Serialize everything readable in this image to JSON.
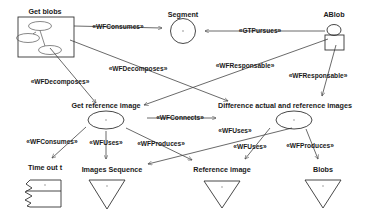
{
  "diagram": {
    "type": "uml-use-case-activity-diagram",
    "background_color": "#ffffff",
    "stroke_color": "#333333",
    "text_color": "#1a1a1a",
    "nodes": [
      {
        "id": "get-blobs",
        "label": "Get blobs",
        "shape": "container-box-with-ellipses"
      },
      {
        "id": "segment",
        "label": "Segment",
        "shape": "circle"
      },
      {
        "id": "ablob",
        "label": "ABlob",
        "shape": "actor"
      },
      {
        "id": "get-ref-image",
        "label": "Get reference image",
        "shape": "ellipse"
      },
      {
        "id": "difference",
        "label": "Difference actual and reference images",
        "shape": "ellipse"
      },
      {
        "id": "time-out",
        "label": "Time out t",
        "shape": "torn-note"
      },
      {
        "id": "images-seq",
        "label": "Images Sequence",
        "shape": "triangle-down"
      },
      {
        "id": "reference-image",
        "label": "Reference image",
        "shape": "triangle-down"
      },
      {
        "id": "blobs",
        "label": "Blobs",
        "shape": "triangle-down"
      }
    ],
    "edges": [
      {
        "id": "e1",
        "label": "«WFConsumes»",
        "from": "get-blobs",
        "to": "segment"
      },
      {
        "id": "e2",
        "label": "«GTPursues»",
        "from": "ablob",
        "to": "segment"
      },
      {
        "id": "e3",
        "label": "«WFDecomposes»",
        "from": "get-blobs",
        "to": "difference"
      },
      {
        "id": "e4",
        "label": "«WFDecomposes»",
        "from": "get-blobs",
        "to": "get-ref-image"
      },
      {
        "id": "e5",
        "label": "«WFResponsable»",
        "from": "ablob",
        "to": "get-ref-image"
      },
      {
        "id": "e6",
        "label": "«WFResponsable»",
        "from": "ablob",
        "to": "difference"
      },
      {
        "id": "e7",
        "label": "«WFConnects»",
        "from": "get-ref-image",
        "to": "difference"
      },
      {
        "id": "e8",
        "label": "«WFConsumes»",
        "from": "get-ref-image",
        "to": "time-out"
      },
      {
        "id": "e9",
        "label": "«WFUses»",
        "from": "get-ref-image",
        "to": "images-seq"
      },
      {
        "id": "e10",
        "label": "«WFProduces»",
        "from": "get-ref-image",
        "to": "reference-image"
      },
      {
        "id": "e11",
        "label": "«WFUses»",
        "from": "difference",
        "to": "images-seq"
      },
      {
        "id": "e12",
        "label": "«WFUses»",
        "from": "difference",
        "to": "reference-image"
      },
      {
        "id": "e13",
        "label": "«WFProduces»",
        "from": "difference",
        "to": "blobs"
      }
    ]
  }
}
